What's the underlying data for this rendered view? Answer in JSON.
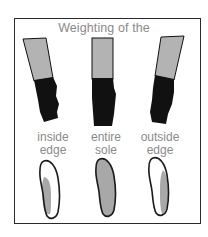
{
  "title": "Weighting of the",
  "columns": [
    {
      "label_line1": "inside",
      "label_line2": "edge",
      "leg_tilt": "left",
      "weighted_region": "inside-edge"
    },
    {
      "label_line1": "entire",
      "label_line2": "sole",
      "leg_tilt": "straight",
      "weighted_region": "entire-sole"
    },
    {
      "label_line1": "outside",
      "label_line2": "edge",
      "leg_tilt": "right",
      "weighted_region": "outside-edge"
    }
  ],
  "colors": {
    "frame": "#2a2a2a",
    "text": "#8a8a8a",
    "leg": "#b3b3b3",
    "boot": "#111111",
    "sole_outline": "#1a1a1a",
    "weighted_area": "#a8a8a8",
    "background": "#ffffff"
  }
}
